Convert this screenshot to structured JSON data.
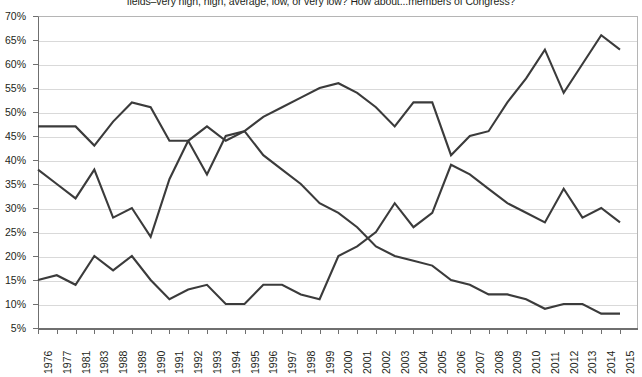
{
  "chart_data": {
    "type": "line",
    "title": "fields–very high, high, average, low, or very low? How about...members of Congress?",
    "xlabel": "",
    "ylabel": "",
    "ylim": [
      5,
      70
    ],
    "ytick_step": 5,
    "grid": true,
    "legend": "none",
    "yticks": [
      "70%",
      "65%",
      "60%",
      "55%",
      "50%",
      "45%",
      "40%",
      "35%",
      "30%",
      "25%",
      "20%",
      "15%",
      "10%",
      "5%"
    ],
    "categories": [
      "1976",
      "1977",
      "1981",
      "1983",
      "1988",
      "1989",
      "1990",
      "1991",
      "1992",
      "1993",
      "1994",
      "1995",
      "1996",
      "1997",
      "1998",
      "1999",
      "2000",
      "2001",
      "2002",
      "2003",
      "2004",
      "2005",
      "2006",
      "2007",
      "2008",
      "2009",
      "2010",
      "2011",
      "2012",
      "2013",
      "2014",
      "2015"
    ],
    "series": [
      {
        "name": "Average",
        "color": "#3b3b3b",
        "values": [
          47,
          47,
          47,
          43,
          48,
          52,
          51,
          44,
          44,
          37,
          45,
          46,
          41,
          38,
          35,
          31,
          29,
          26,
          22,
          20,
          19,
          18,
          15,
          14,
          12,
          12,
          11,
          9,
          10,
          10,
          8,
          8
        ]
      },
      {
        "name": "Low or very low",
        "color": "#3b3b3b",
        "values": [
          38,
          35,
          32,
          38,
          28,
          30,
          24,
          36,
          44,
          47,
          44,
          46,
          49,
          51,
          53,
          55,
          56,
          54,
          51,
          47,
          52,
          52,
          41,
          45,
          46,
          52,
          57,
          63,
          54,
          60,
          66,
          63
        ]
      },
      {
        "name": "High or very high",
        "color": "#3b3b3b",
        "values": [
          15,
          16,
          14,
          20,
          17,
          20,
          15,
          11,
          13,
          14,
          10,
          10,
          14,
          14,
          12,
          11,
          20,
          22,
          25,
          31,
          26,
          29,
          39,
          37,
          34,
          31,
          29,
          27,
          34,
          28,
          30,
          27
        ]
      }
    ]
  },
  "axes": {
    "y_max_label": "70%",
    "y_min_label": "5%"
  }
}
